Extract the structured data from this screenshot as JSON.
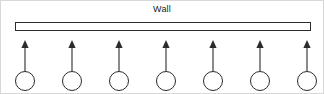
{
  "figure": {
    "title": "Wall",
    "width": 324,
    "height": 94,
    "background_color": "#ffffff",
    "border_color": "#d8d8d8",
    "stroke_color": "#2b2b2b",
    "text_color": "#1a1a1a"
  },
  "wall": {
    "label": "Wall",
    "left": 14,
    "top": 21,
    "width": 296,
    "height": 9,
    "fill": "#ffffff",
    "stroke": "#2b2b2b"
  },
  "units": {
    "count": 7,
    "circle_diameter": 20,
    "arrow_length": 30,
    "centers_x": [
      24,
      71,
      118,
      165,
      212,
      259,
      306
    ],
    "items": [
      {
        "index": 1,
        "cx": 24,
        "arrow_direction": "up",
        "circle_fill": "none"
      },
      {
        "index": 2,
        "cx": 71,
        "arrow_direction": "up",
        "circle_fill": "none"
      },
      {
        "index": 3,
        "cx": 118,
        "arrow_direction": "up",
        "circle_fill": "none"
      },
      {
        "index": 4,
        "cx": 165,
        "arrow_direction": "up",
        "circle_fill": "none"
      },
      {
        "index": 5,
        "cx": 212,
        "arrow_direction": "up",
        "circle_fill": "none"
      },
      {
        "index": 6,
        "cx": 259,
        "arrow_direction": "up",
        "circle_fill": "none"
      },
      {
        "index": 7,
        "cx": 306,
        "arrow_direction": "up",
        "circle_fill": "none"
      }
    ]
  }
}
